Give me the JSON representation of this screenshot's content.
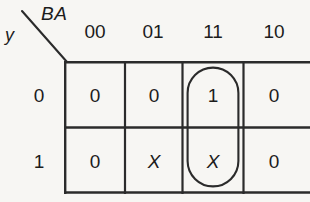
{
  "figure": {
    "type": "karnaugh-map",
    "rows": 2,
    "columns": 4,
    "column_variable_label": "BA",
    "row_variable_label": "y",
    "column_headers": [
      "00",
      "01",
      "11",
      "10"
    ],
    "row_headers": [
      "0",
      "1"
    ],
    "cells": [
      [
        "0",
        "0",
        "1",
        "0"
      ],
      [
        "0",
        "X",
        "X",
        "0"
      ]
    ],
    "grouping": {
      "shape": "rounded-oval",
      "covers_column": "11",
      "covers_rows": [
        "0",
        "1"
      ],
      "covered_values": [
        "1",
        "X"
      ]
    },
    "colors": {
      "background": "#f7f6f3",
      "ink": "#1c1c1c",
      "grid_line": "#2b2b2b",
      "group_line": "#2b2b2b"
    }
  }
}
